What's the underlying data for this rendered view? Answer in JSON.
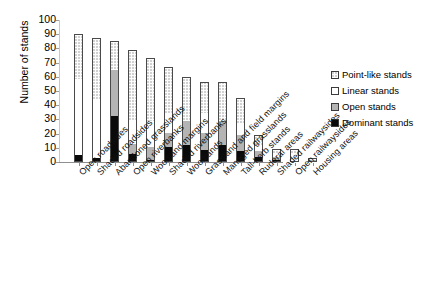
{
  "chart_data": {
    "type": "bar",
    "subtype": "stacked-bar",
    "title": "",
    "xlabel": "",
    "ylabel": "Number of stands",
    "ylim": [
      0,
      100
    ],
    "yticks": [
      0,
      10,
      20,
      30,
      40,
      50,
      60,
      70,
      80,
      90,
      100
    ],
    "grid": false,
    "legend_position": "right",
    "categories": [
      "Open roadsides",
      "Shaded roadsides",
      "Abandoned grasslands",
      "Open riverbanks",
      "Woodland margins",
      "Shaded riverbanks",
      "Woodlands",
      "Grassland and field margins",
      "Managed grasslands",
      "Tall-herb stands",
      "Ruderal areas",
      "Shaded railwaysides",
      "Open railwaysides",
      "Housing areas"
    ],
    "series": [
      {
        "name": "Dominant stands",
        "color": "#0a0a0a",
        "values": [
          4,
          2,
          32,
          5,
          1,
          10,
          11,
          8,
          11,
          7,
          3,
          1,
          0,
          0
        ]
      },
      {
        "name": "Open stands",
        "color": "#b4b4b4",
        "values": [
          0,
          0,
          32,
          7,
          9,
          10,
          17,
          12,
          17,
          11,
          4,
          2,
          0,
          1
        ]
      },
      {
        "name": "Linear stands",
        "color": "#ffffff",
        "values": [
          54,
          42,
          0,
          17,
          18,
          14,
          0,
          14,
          0,
          8,
          4,
          2,
          5,
          0
        ]
      },
      {
        "name": "Point-like stands",
        "color": "#fdfdfd",
        "values": [
          32,
          43,
          21,
          50,
          45,
          33,
          32,
          22,
          28,
          19,
          8,
          4,
          4,
          2
        ]
      }
    ],
    "totals": [
      90,
      87,
      85,
      79,
      73,
      67,
      60,
      56,
      56,
      45,
      19,
      9,
      9,
      3
    ]
  },
  "legend": {
    "items": [
      {
        "label": "Point-like stands",
        "swatch": "point-like-swatch"
      },
      {
        "label": "Linear stands",
        "swatch": "linear-swatch"
      },
      {
        "label": "Open stands",
        "swatch": "open-swatch"
      },
      {
        "label": "Dominant stands",
        "swatch": "dominant-swatch"
      }
    ]
  }
}
